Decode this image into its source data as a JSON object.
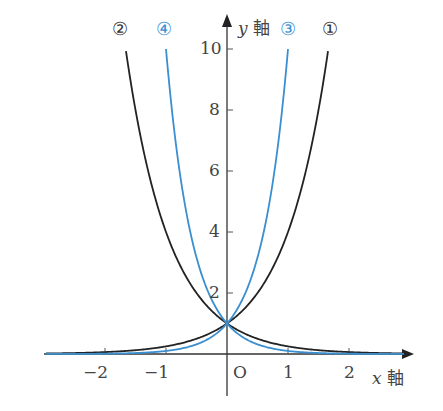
{
  "chart_data": {
    "type": "line",
    "title": "",
    "xlabel": "x 軸",
    "ylabel": "y 軸",
    "x_ticks": [
      "-2",
      "-1",
      "O",
      "1",
      "2"
    ],
    "y_ticks": [
      "2",
      "4",
      "6",
      "8",
      "10"
    ],
    "xlim": [
      -3.0,
      2.9
    ],
    "ylim": [
      0,
      10.5
    ],
    "grid": false,
    "legend": "curve labels at top",
    "series": [
      {
        "name": "①",
        "function": "y = 4^x",
        "color": "#222222",
        "x": [
          -3,
          -2,
          -1,
          0,
          1,
          1.5,
          1.66
        ],
        "values": [
          0.016,
          0.0625,
          0.25,
          1,
          4,
          8,
          10
        ]
      },
      {
        "name": "②",
        "function": "y = (1/4)^x",
        "color": "#222222",
        "x": [
          -1.66,
          -1.5,
          -1,
          0,
          1,
          2,
          3
        ],
        "values": [
          10,
          8,
          4,
          1,
          0.25,
          0.0625,
          0.016
        ]
      },
      {
        "name": "③",
        "function": "y = 10^x",
        "color": "#3a8fd0",
        "x": [
          -3,
          -2,
          -1,
          0,
          0.5,
          1
        ],
        "values": [
          0.001,
          0.01,
          0.1,
          1,
          3.16,
          10
        ]
      },
      {
        "name": "④",
        "function": "y = (1/10)^x",
        "color": "#3a8fd0",
        "x": [
          -1,
          -0.5,
          0,
          1,
          2,
          3
        ],
        "values": [
          10,
          3.16,
          1,
          0.1,
          0.01,
          0.001
        ]
      }
    ]
  },
  "labels": {
    "x_axis": "x",
    "y_axis": "y",
    "axis_kanji": "軸",
    "origin": "O",
    "curve1": "①",
    "curve2": "②",
    "curve3": "③",
    "curve4": "④",
    "xt_m2": "−2",
    "xt_m1": "−1",
    "xt_1": "1",
    "xt_2": "2",
    "yt_2": "2",
    "yt_4": "4",
    "yt_6": "6",
    "yt_8": "8",
    "yt_10": "10"
  },
  "colors": {
    "black": "#222222",
    "blue": "#3a8fd0"
  }
}
